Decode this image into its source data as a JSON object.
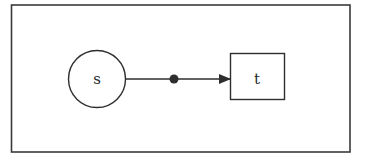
{
  "diagram": {
    "nodes": [
      {
        "id": "s",
        "label": "s",
        "shape": "circle"
      },
      {
        "id": "t",
        "label": "t",
        "shape": "rectangle"
      }
    ],
    "edges": [
      {
        "from": "s",
        "to": "t",
        "directed": true,
        "midpoint_marker": "filled-dot"
      }
    ],
    "colors": {
      "stroke": "#2e2e2e",
      "background": "#ffffff"
    }
  }
}
